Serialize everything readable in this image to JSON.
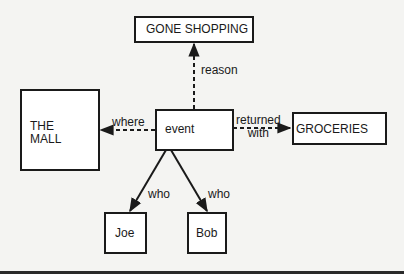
{
  "diagram": {
    "type": "semantic-network",
    "nodes": {
      "event": "event",
      "reason_target": "GONE SHOPPING",
      "where_target": "THE\nMALL",
      "with_target": "GROCERIES",
      "who_1": "Joe",
      "who_2": "Bob"
    },
    "edges": {
      "reason": "reason",
      "where": "where",
      "returned_with": "returned\nwith",
      "who_1": "who",
      "who_2": "who"
    }
  },
  "colors": {
    "line": "#1a1a1a",
    "background": "#f4f4f2"
  }
}
